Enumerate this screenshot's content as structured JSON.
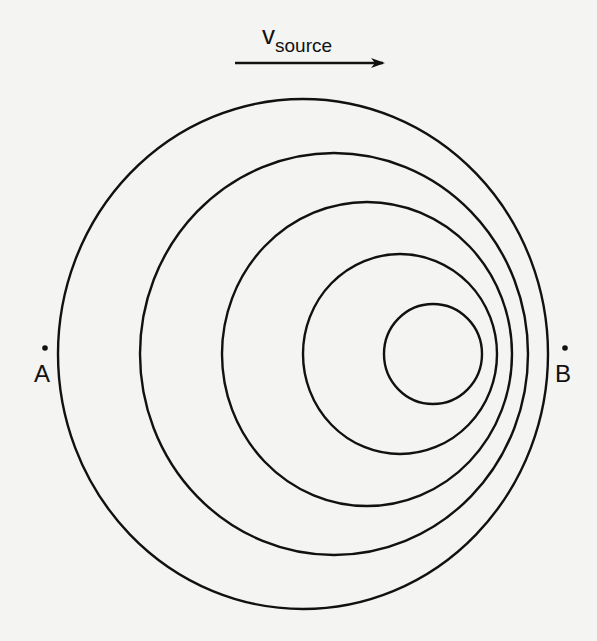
{
  "diagram": {
    "velocity_label": {
      "main": "v",
      "subscript": "source"
    },
    "arrow": {
      "x1": 235,
      "y1": 63,
      "x2": 383,
      "y2": 63,
      "direction": "right"
    },
    "points": [
      {
        "label": "A",
        "x": 45,
        "y": 348
      },
      {
        "label": "B",
        "x": 565,
        "y": 348
      }
    ],
    "wavefronts": [
      {
        "cx": 303,
        "cy": 354,
        "rx": 245,
        "ry": 255
      },
      {
        "cx": 334,
        "cy": 354,
        "rx": 194,
        "ry": 201
      },
      {
        "cx": 367,
        "cy": 354,
        "rx": 145,
        "ry": 152
      },
      {
        "cx": 400,
        "cy": 354,
        "rx": 97,
        "ry": 100
      },
      {
        "cx": 433,
        "cy": 354,
        "rx": 49,
        "ry": 50
      }
    ],
    "stroke_color": "#111111",
    "background": "#f4f4f2"
  }
}
